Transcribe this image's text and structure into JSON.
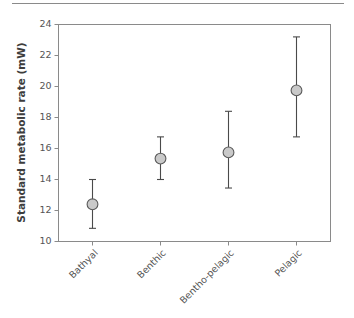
{
  "figure": {
    "background_color": "#ffffff",
    "top_rule_color": "#8a8a8a",
    "axis_color": "#8a8a8a",
    "marker_fill": "#c9c9c9",
    "marker_stroke": "#5a5a5a",
    "errorbar_color": "#4a4a4a"
  },
  "chart_data": {
    "type": "scatter",
    "title": "",
    "subtitle": "",
    "xlabel": "",
    "ylabel": "Standard metabolic rate (mW)",
    "categories": [
      "Bathyal",
      "Benthic",
      "Bentho-pelagic",
      "Pelagic"
    ],
    "values": [
      12.4,
      15.35,
      15.75,
      19.75
    ],
    "error_low": [
      10.85,
      14.0,
      13.45,
      16.75
    ],
    "error_high": [
      14.0,
      16.75,
      18.4,
      23.2
    ],
    "ylim": [
      10,
      24
    ],
    "yticks": [
      10,
      12,
      14,
      16,
      18,
      20,
      22,
      24
    ],
    "ytick_labels": [
      "10",
      "12",
      "14",
      "16",
      "18",
      "20",
      "22",
      "24"
    ],
    "grid": false,
    "legend": null,
    "marker_shape": "circle",
    "error_representation": "95% confidence interval",
    "xtick_label_rotation": 45
  }
}
